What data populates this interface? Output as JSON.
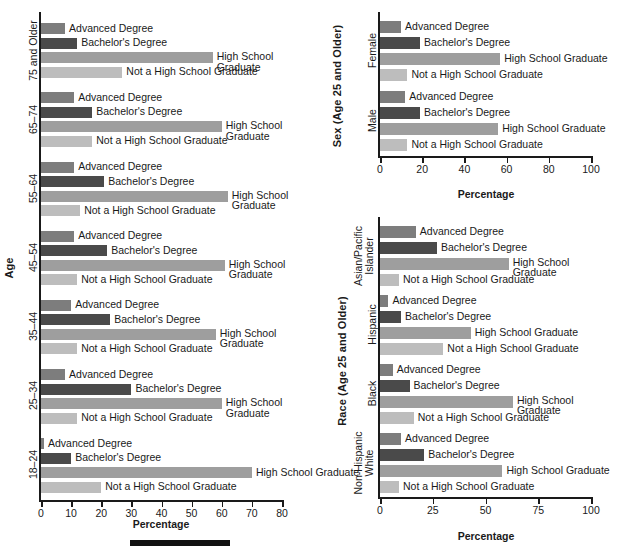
{
  "figure": {
    "background": "#ffffff",
    "series_colors": {
      "Advanced Degree": "#7d7d7d",
      "Bachelor's Degree": "#4a4a4a",
      "High School Graduate": "#9e9e9e",
      "Not a High School Graduate": "#bdbdbd"
    },
    "series_order": [
      "Advanced Degree",
      "Bachelor's Degree",
      "High School Graduate",
      "Not a High School Graduate"
    ],
    "xaxis_title": "Percentage"
  },
  "panels": {
    "age": {
      "ylabel": "Age",
      "xlabel": "Percentage",
      "xlim": [
        0,
        80
      ],
      "xticks": [
        "0",
        "10",
        "20",
        "30",
        "40",
        "50",
        "60",
        "70",
        "80"
      ],
      "groups": [
        {
          "label": "75 and Older",
          "label_lines": [
            "75 and Older"
          ]
        },
        {
          "label": "65–74",
          "label_lines": [
            "65–74"
          ]
        },
        {
          "label": "55–64",
          "label_lines": [
            "55–64"
          ]
        },
        {
          "label": "45–54",
          "label_lines": [
            "45–54"
          ]
        },
        {
          "label": "35–44",
          "label_lines": [
            "35–44"
          ]
        },
        {
          "label": "25–34",
          "label_lines": [
            "25–34"
          ]
        },
        {
          "label": "18–24",
          "label_lines": [
            "18–24"
          ]
        }
      ]
    },
    "sex": {
      "ylabel": "Sex (Age 25 and Older)",
      "xlabel": "Percentage",
      "xlim": [
        0,
        100
      ],
      "xticks": [
        "0",
        "20",
        "40",
        "60",
        "80",
        "100"
      ],
      "groups": [
        {
          "label": "Female",
          "label_lines": [
            "Female"
          ]
        },
        {
          "label": "Male",
          "label_lines": [
            "Male"
          ]
        }
      ]
    },
    "race": {
      "ylabel": "Race (Age 25 and Older)",
      "xlabel": "Percentage",
      "xlim": [
        0,
        100
      ],
      "xticks": [
        "0",
        "25",
        "50",
        "75",
        "100"
      ],
      "groups": [
        {
          "label": "Asian/Pacific Islander",
          "label_lines": [
            "Asian/Pacific",
            "Islander"
          ]
        },
        {
          "label": "Hispanic",
          "label_lines": [
            "Hispanic"
          ]
        },
        {
          "label": "Black",
          "label_lines": [
            "Black"
          ]
        },
        {
          "label": "Non-Hispanic White",
          "label_lines": [
            "Non-Hispanic",
            "White"
          ]
        }
      ]
    }
  },
  "chart_data": [
    {
      "type": "bar",
      "orientation": "horizontal",
      "id": "age",
      "title": "",
      "xlabel": "Percentage",
      "ylabel": "Age",
      "xlim": [
        0,
        80
      ],
      "xticks": [
        0,
        10,
        20,
        30,
        40,
        50,
        60,
        70,
        80
      ],
      "grid": false,
      "legend": "inline-bar-labels",
      "categories": [
        "75 and Older",
        "65–74",
        "55–64",
        "45–54",
        "35–44",
        "25–34",
        "18–24"
      ],
      "series": [
        {
          "name": "Advanced Degree",
          "values": [
            8,
            11,
            11,
            11,
            10,
            8,
            1
          ]
        },
        {
          "name": "Bachelor's Degree",
          "values": [
            12,
            17,
            21,
            22,
            23,
            30,
            10
          ]
        },
        {
          "name": "High School Graduate",
          "values": [
            57,
            60,
            62,
            61,
            58,
            60,
            70
          ]
        },
        {
          "name": "Not a High School Graduate",
          "values": [
            27,
            17,
            13,
            12,
            12,
            12,
            20
          ]
        }
      ]
    },
    {
      "type": "bar",
      "orientation": "horizontal",
      "id": "sex",
      "title": "",
      "xlabel": "Percentage",
      "ylabel": "Sex (Age 25 and Older)",
      "xlim": [
        0,
        100
      ],
      "xticks": [
        0,
        20,
        40,
        60,
        80,
        100
      ],
      "grid": false,
      "legend": "inline-bar-labels",
      "categories": [
        "Female",
        "Male"
      ],
      "series": [
        {
          "name": "Advanced Degree",
          "values": [
            10,
            12
          ]
        },
        {
          "name": "Bachelor's Degree",
          "values": [
            19,
            19
          ]
        },
        {
          "name": "High School Graduate",
          "values": [
            57,
            56
          ]
        },
        {
          "name": "Not a High School Graduate",
          "values": [
            13,
            13
          ]
        }
      ]
    },
    {
      "type": "bar",
      "orientation": "horizontal",
      "id": "race",
      "title": "",
      "xlabel": "Percentage",
      "ylabel": "Race (Age 25 and Older)",
      "xlim": [
        0,
        100
      ],
      "xticks": [
        0,
        25,
        50,
        75,
        100
      ],
      "grid": false,
      "legend": "inline-bar-labels",
      "categories": [
        "Asian/Pacific Islander",
        "Hispanic",
        "Black",
        "Non-Hispanic White"
      ],
      "series": [
        {
          "name": "Advanced Degree",
          "values": [
            17,
            4,
            6,
            10
          ]
        },
        {
          "name": "Bachelor's Degree",
          "values": [
            27,
            10,
            14,
            21
          ]
        },
        {
          "name": "High School Graduate",
          "values": [
            61,
            43,
            63,
            58
          ]
        },
        {
          "name": "Not a High School Graduate",
          "values": [
            9,
            30,
            16,
            9
          ]
        }
      ]
    }
  ],
  "bar_labels": {
    "advanced": "Advanced Degree",
    "bachelors": "Bachelor's Degree",
    "hs_one_line": "High School Graduate",
    "hs_two_line": "High School\nGraduate",
    "not_hs": "Not a High School Graduate"
  }
}
